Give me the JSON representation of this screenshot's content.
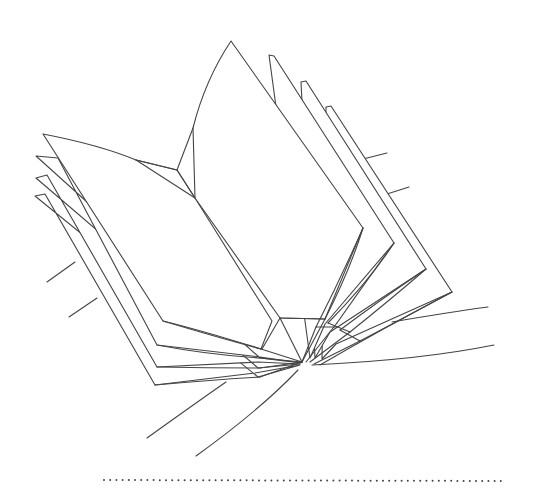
{
  "illustration": {
    "subject": "open-book-line-drawing",
    "stroke_color": "#444444",
    "background_color": "#ffffff"
  },
  "divider": {
    "style": "dotted",
    "color": "#444444"
  }
}
